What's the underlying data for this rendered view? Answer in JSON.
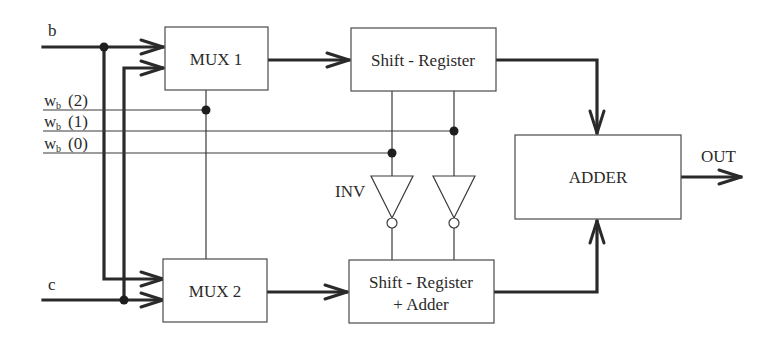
{
  "diagram": {
    "inputs": {
      "b": "b",
      "c": "c",
      "wb2_main": "w",
      "wb2_sub": "b",
      "wb2_idx": "(2)",
      "wb1_main": "w",
      "wb1_sub": "b",
      "wb1_idx": "(1)",
      "wb0_main": "w",
      "wb0_sub": "b",
      "wb0_idx": "(0)"
    },
    "blocks": {
      "mux1": "MUX 1",
      "mux2": "MUX 2",
      "shift_register": "Shift - Register",
      "shift_register_adder_line1": "Shift - Register",
      "shift_register_adder_line2": "+ Adder",
      "adder": "ADDER"
    },
    "inverter_label": "INV",
    "output_label": "OUT"
  }
}
